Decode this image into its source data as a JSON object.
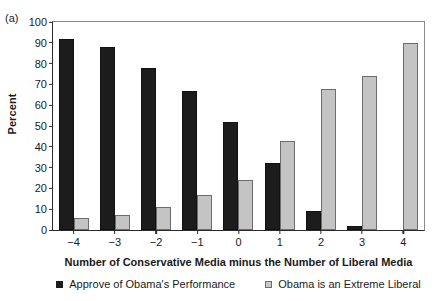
{
  "panel": {
    "letter": "(a)"
  },
  "chart_data": {
    "type": "bar",
    "title": "",
    "xlabel": "Number of Conservative Media minus the Number of Liberal Media",
    "ylabel": "Percent",
    "categories": [
      "−4",
      "−3",
      "−2",
      "−1",
      "0",
      "1",
      "2",
      "3",
      "4"
    ],
    "yticks": [
      "0",
      "10",
      "20",
      "30",
      "40",
      "50",
      "60",
      "70",
      "80",
      "90",
      "100"
    ],
    "ylim": [
      0,
      100
    ],
    "grid": false,
    "legend_position": "bottom-center",
    "series": [
      {
        "name": "Approve of Obama's Performance",
        "color": "#1c1c1c",
        "values": [
          92,
          88,
          78,
          67,
          52,
          32,
          9,
          2,
          0
        ]
      },
      {
        "name": "Obama is an Extreme Liberal",
        "color": "#c4c4c4",
        "values": [
          6,
          7,
          11,
          17,
          24,
          43,
          68,
          74,
          90
        ]
      }
    ]
  }
}
